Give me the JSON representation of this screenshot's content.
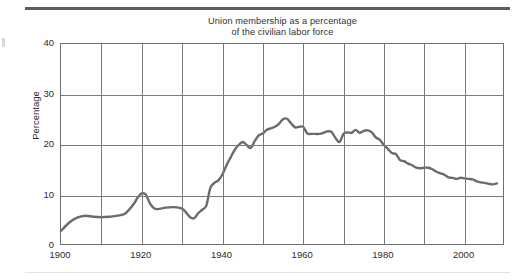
{
  "figure": {
    "title_line1": "Union membership as a percentage",
    "title_line2": "of the civilian labor force",
    "title": "Union membership as a percentage\nof the civilian labor force",
    "line_color": "#6b6b6b",
    "grid_color": "#7a7a7a",
    "frame_color": "#6f6f6f",
    "rule_color": "#5e5e5e"
  },
  "axes": {
    "ylabel": "Percentage",
    "yticks": [
      "0",
      "10",
      "20",
      "30",
      "40"
    ],
    "xticks": [
      "1900",
      "1920",
      "1940",
      "1960",
      "1980",
      "2000"
    ]
  },
  "chart_data": {
    "type": "line",
    "title": "Union membership as a percentage of the civilian labor force",
    "xlabel": "",
    "ylabel": "Percentage",
    "xlim": [
      1900,
      2010
    ],
    "ylim": [
      0,
      40
    ],
    "ytick_values": [
      0,
      10,
      20,
      30,
      40
    ],
    "xtick_values": [
      1900,
      1920,
      1940,
      1960,
      1980,
      2000
    ],
    "grid": true,
    "grid_x_every": 10,
    "grid_y_every": 10,
    "legend": "none",
    "series": [
      {
        "name": "Union membership (% of civilian labor force)",
        "x": [
          1900,
          1902,
          1904,
          1906,
          1908,
          1910,
          1912,
          1914,
          1916,
          1918,
          1919,
          1920,
          1921,
          1922,
          1923,
          1924,
          1926,
          1928,
          1930,
          1931,
          1932,
          1933,
          1934,
          1935,
          1936,
          1937,
          1938,
          1939,
          1940,
          1941,
          1942,
          1943,
          1944,
          1945,
          1946,
          1947,
          1948,
          1949,
          1950,
          1951,
          1952,
          1953,
          1954,
          1955,
          1956,
          1957,
          1958,
          1959,
          1960,
          1961,
          1962,
          1963,
          1964,
          1965,
          1966,
          1967,
          1968,
          1969,
          1970,
          1971,
          1972,
          1973,
          1974,
          1975,
          1976,
          1977,
          1978,
          1979,
          1980,
          1981,
          1982,
          1983,
          1984,
          1985,
          1986,
          1987,
          1988,
          1989,
          1990,
          1991,
          1992,
          1993,
          1994,
          1995,
          1996,
          1997,
          1998,
          1999,
          2000,
          2001,
          2002,
          2003,
          2004,
          2005,
          2006,
          2007,
          2008
        ],
        "y": [
          3.0,
          4.6,
          5.6,
          6.0,
          5.8,
          5.7,
          5.8,
          6.0,
          6.5,
          8.3,
          9.6,
          10.4,
          10.2,
          8.5,
          7.5,
          7.3,
          7.6,
          7.7,
          7.4,
          6.6,
          5.7,
          5.5,
          6.5,
          7.2,
          8.0,
          11.5,
          12.5,
          13.0,
          14.2,
          16.0,
          17.5,
          19.0,
          20.0,
          20.6,
          20.0,
          19.4,
          20.8,
          21.9,
          22.3,
          23.0,
          23.3,
          23.6,
          24.2,
          25.1,
          25.2,
          24.3,
          23.5,
          23.6,
          23.6,
          22.3,
          22.2,
          22.2,
          22.2,
          22.4,
          22.7,
          22.6,
          21.4,
          20.6,
          22.2,
          22.5,
          22.4,
          23.0,
          22.4,
          22.8,
          22.9,
          22.5,
          21.5,
          21.0,
          20.0,
          19.2,
          18.4,
          18.2,
          17.0,
          16.8,
          16.3,
          16.0,
          15.5,
          15.4,
          15.5,
          15.5,
          15.2,
          14.7,
          14.4,
          14.1,
          13.6,
          13.5,
          13.3,
          13.5,
          13.4,
          13.3,
          13.2,
          12.8,
          12.6,
          12.5,
          12.3,
          12.2,
          12.4
        ]
      }
    ],
    "annotations": {
      "peak": {
        "year": 1955,
        "value": 25.2
      },
      "start": {
        "year": 1900,
        "value": 3.0
      },
      "end": {
        "year": 2008,
        "value": 12.4
      },
      "trough_1930s": {
        "year": 1933,
        "value": 5.5
      },
      "local_peak_1920": {
        "year": 1920,
        "value": 10.4
      }
    }
  }
}
